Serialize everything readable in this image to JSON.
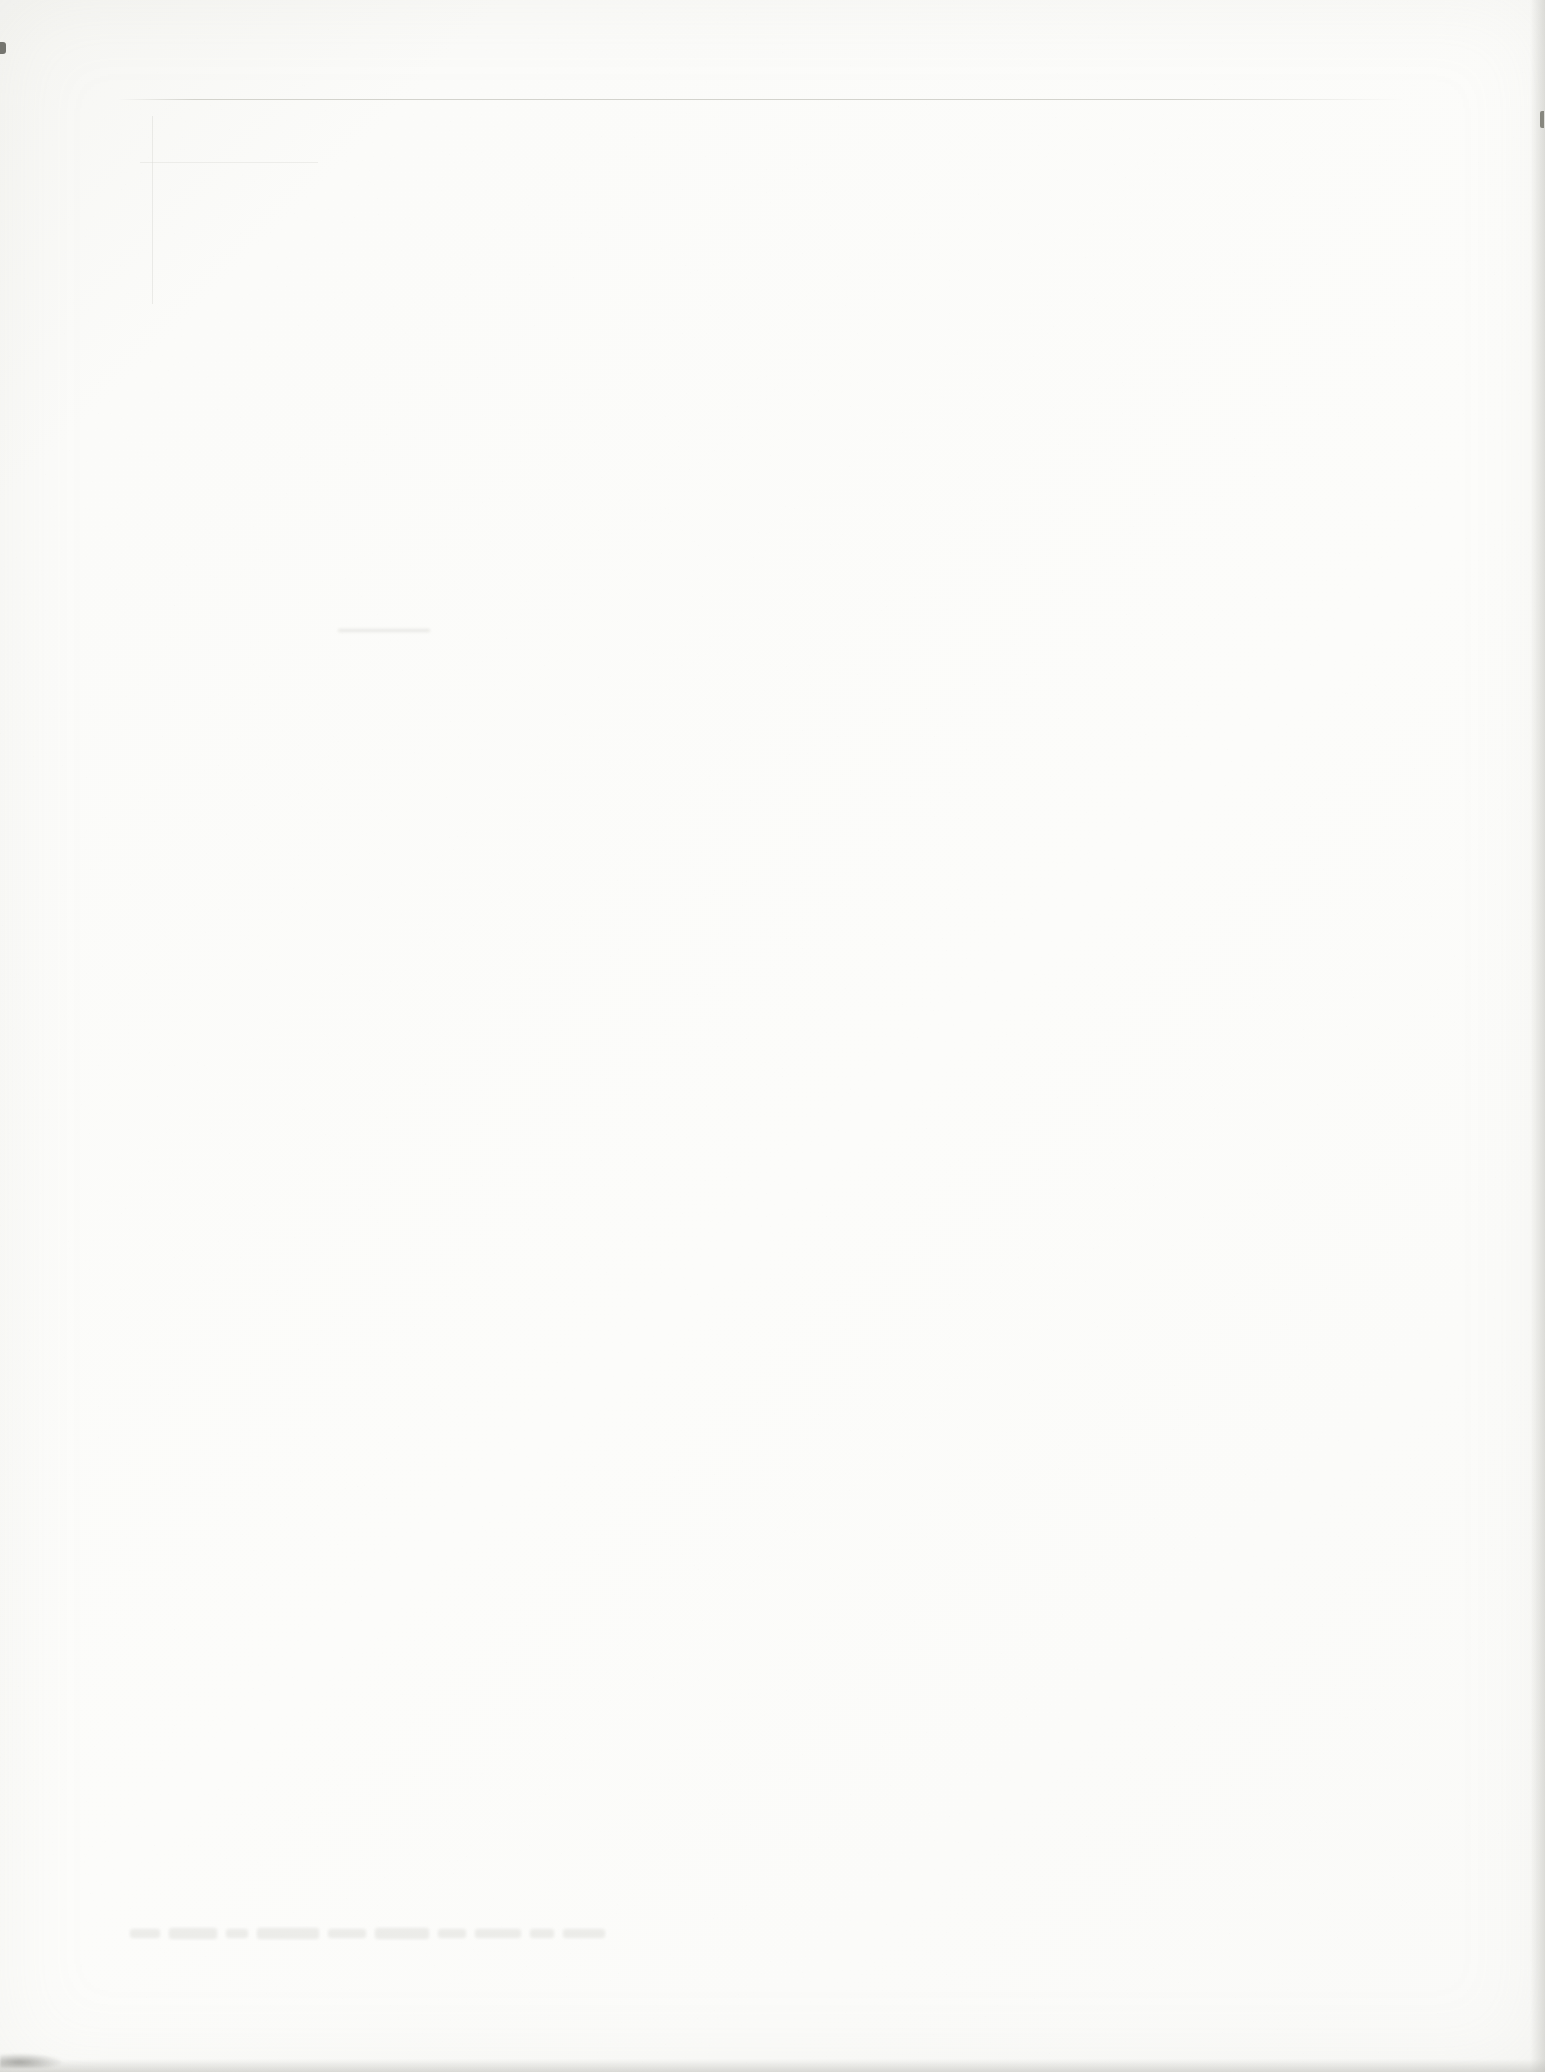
{
  "document_scan": {
    "paper": {
      "base_color": "#fcfcfa",
      "corner_tint_color": "#f6f6f3",
      "grain_speck_color": "#9a9a94"
    },
    "legible_text": "",
    "artifacts": {
      "top_hairline": {
        "color": "#ccccc5"
      },
      "ghost_bleedthrough_text": {
        "color": "#9d9d96",
        "legible": false
      },
      "upper_left_showthrough_lines": {
        "color": "#d8d8d2"
      },
      "center_showthrough_dash": {
        "color": "#d5d5cf"
      },
      "right_edge_shadow": {
        "color": "#c5c5c0"
      },
      "bottom_edge_shadow": {
        "color": "#babab5"
      },
      "bottom_left_smudge": {
        "color": "#6e6e69"
      },
      "left_edge_nick": {
        "color": "#75756f"
      },
      "right_edge_nick": {
        "color": "#87877f"
      }
    }
  }
}
